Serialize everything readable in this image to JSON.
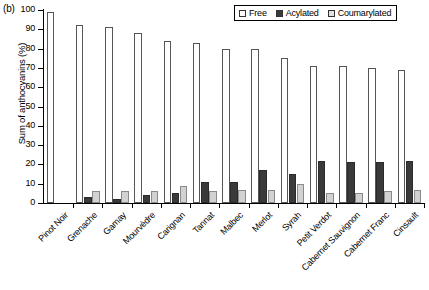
{
  "panel": {
    "label": "(b)"
  },
  "chart_data": {
    "type": "bar",
    "title": "",
    "xlabel": "",
    "ylabel": "Sum of anthocyanins (%)",
    "ylim": [
      0,
      100
    ],
    "yticks": [
      0,
      10,
      20,
      30,
      40,
      50,
      60,
      70,
      80,
      90,
      100
    ],
    "grid": false,
    "legend_position": "top-right",
    "categories": [
      "Pinot Noir",
      "Grenache",
      "Gamay",
      "Mourvèdre",
      "Carignan",
      "Tannat",
      "Malbec",
      "Merlot",
      "Syrah",
      "Petit Verdot",
      "Cabernet Sauvignon",
      "Cabernet Franc",
      "Cinsault"
    ],
    "series": [
      {
        "name": "Free",
        "color": "#ffffff",
        "values": [
          99,
          92,
          91,
          88,
          84,
          83,
          80,
          80,
          75,
          71,
          71,
          70,
          69
        ]
      },
      {
        "name": "Acylated",
        "color": "#3a3a3a",
        "values": [
          0,
          3,
          2,
          4,
          5,
          11,
          11,
          17,
          15,
          22,
          21,
          21,
          22
        ]
      },
      {
        "name": "Coumarylated",
        "color": "#d2d2d2",
        "values": [
          0,
          6,
          6,
          6,
          9,
          6,
          7,
          7,
          10,
          5,
          5,
          6,
          7
        ]
      }
    ]
  },
  "legend": {
    "items": [
      {
        "label": "Free"
      },
      {
        "label": "Acylated"
      },
      {
        "label": "Coumarylated"
      }
    ]
  }
}
